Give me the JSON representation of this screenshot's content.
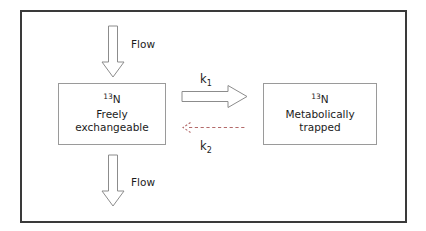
{
  "figure": {
    "type": "compartment-model-diagram",
    "border_color": "#3a3a3a",
    "box_border_color": "#9a9a9a",
    "arrow_stroke_color": "#8a8a8a",
    "text_color": "#1c1c1c",
    "background": "#ffffff"
  },
  "compartments": [
    {
      "id": "freely-exchangeable",
      "isotope_mass": "13",
      "isotope_symbol": "N",
      "line1": "Freely",
      "line2": "exchangeable"
    },
    {
      "id": "metabolically-trapped",
      "isotope_mass": "13",
      "isotope_symbol": "N",
      "line1": "Metabolically",
      "line2": "trapped"
    }
  ],
  "flow_arrows": {
    "top_label": "Flow",
    "bottom_label": "Flow"
  },
  "rate_constants": {
    "forward": {
      "symbol": "k",
      "subscript": "1",
      "style": "solid-outline-block-arrow",
      "direction": "right"
    },
    "reverse": {
      "symbol": "k",
      "subscript": "2",
      "style": "dashed-arrow",
      "direction": "left"
    }
  }
}
